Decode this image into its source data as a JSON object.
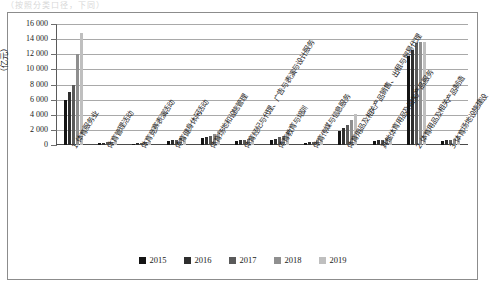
{
  "top_strip_text": "（按照分类口径，下同）",
  "chart_data": {
    "type": "bar",
    "title": "",
    "xlabel": "",
    "ylabel": "（亿元）",
    "ylim": [
      0,
      16000
    ],
    "ytick_values": [
      0,
      2000,
      4000,
      6000,
      8000,
      10000,
      12000,
      14000,
      16000
    ],
    "ytick_labels": [
      "0",
      "2 000",
      "4 000",
      "6 000",
      "8 000",
      "10 000",
      "12 000",
      "14 000",
      "16 000"
    ],
    "grid": true,
    "legend_position": "bottom",
    "categories": [
      "1 体育服务业",
      "体育管理活动",
      "体育竞赛表演活动",
      "体育健身休闲活动",
      "体育场地和设施管理",
      "体育经纪与代理、广告与表演与设计服务",
      "体育教育与培训",
      "体育传媒与信息服务",
      "体育用品及相关产品销售、出租与贸易代理",
      "其他体育用品及相关产品服务",
      "2 体育用品及相关产品制造",
      "3 体育场地设施建设"
    ],
    "series": [
      {
        "name": "2015",
        "color": "#141414",
        "values": [
          6000,
          250,
          200,
          500,
          900,
          500,
          700,
          300,
          1900,
          500,
          11800,
          500
        ]
      },
      {
        "name": "2016",
        "color": "#2e2e2e",
        "values": [
          7000,
          300,
          250,
          600,
          1050,
          600,
          850,
          350,
          2300,
          600,
          12500,
          600
        ]
      },
      {
        "name": "2017",
        "color": "#5a5a5a",
        "values": [
          8000,
          350,
          300,
          700,
          1200,
          700,
          1000,
          450,
          2700,
          700,
          13500,
          700
        ]
      },
      {
        "name": "2018",
        "color": "#8f8f8f",
        "values": [
          12000,
          450,
          400,
          900,
          1500,
          850,
          1250,
          600,
          3300,
          900,
          13600,
          850
        ]
      },
      {
        "name": "2019",
        "color": "#bfbfbf",
        "values": [
          14800,
          600,
          500,
          1100,
          1900,
          1000,
          1550,
          800,
          4100,
          1100,
          13600,
          1050
        ]
      }
    ]
  },
  "legend": {
    "items": [
      {
        "label": "2015",
        "color": "#141414"
      },
      {
        "label": "2016",
        "color": "#2e2e2e"
      },
      {
        "label": "2017",
        "color": "#5a5a5a"
      },
      {
        "label": "2018",
        "color": "#8f8f8f"
      },
      {
        "label": "2019",
        "color": "#bfbfbf"
      }
    ]
  }
}
